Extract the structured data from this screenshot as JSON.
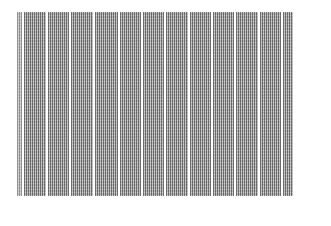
{
  "document": {
    "type": "scanned dense numeric table",
    "legible": false,
    "column_count": 13,
    "columns": [
      {
        "index": 0,
        "width": 5
      },
      {
        "index": 1,
        "width": 22
      },
      {
        "index": 2,
        "width": 21
      },
      {
        "index": 3,
        "width": 22
      },
      {
        "index": 4,
        "width": 23
      },
      {
        "index": 5,
        "width": 21
      },
      {
        "index": 6,
        "width": 21
      },
      {
        "index": 7,
        "width": 22
      },
      {
        "index": 8,
        "width": 21
      },
      {
        "index": 9,
        "width": 21
      },
      {
        "index": 10,
        "width": 22
      },
      {
        "index": 11,
        "width": 21
      },
      {
        "index": 12,
        "width": 10
      }
    ],
    "colors": {
      "background": "#ffffff",
      "ink": "#282828",
      "tone": "#b9b9b9"
    }
  }
}
